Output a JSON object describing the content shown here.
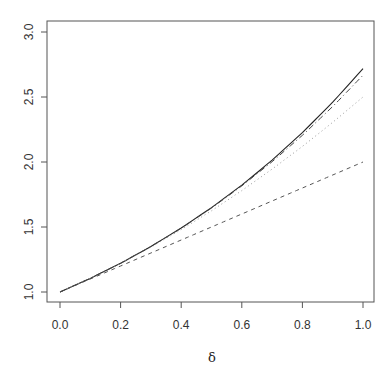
{
  "chart_data": {
    "type": "line",
    "title": "",
    "xlabel": "δ",
    "ylabel": "",
    "xlim": [
      0.0,
      1.0
    ],
    "ylim": [
      1.0,
      3.0
    ],
    "grid": false,
    "legend": null,
    "x_ticks": [
      "0.0",
      "0.2",
      "0.4",
      "0.6",
      "0.8",
      "1.0"
    ],
    "y_ticks": [
      "1.0",
      "1.5",
      "2.0",
      "2.5",
      "3.0"
    ],
    "x": [
      0.0,
      0.1,
      0.2,
      0.3,
      0.4,
      0.5,
      0.6,
      0.7,
      0.8,
      0.9,
      1.0
    ],
    "series": [
      {
        "name": "exp(δ)",
        "style": "solid",
        "values": [
          1.0,
          1.105,
          1.221,
          1.35,
          1.492,
          1.649,
          1.822,
          2.014,
          2.226,
          2.46,
          2.718
        ]
      },
      {
        "name": "1 + δ",
        "style": "dashed",
        "values": [
          1.0,
          1.1,
          1.2,
          1.3,
          1.4,
          1.5,
          1.6,
          1.7,
          1.8,
          1.9,
          2.0
        ]
      },
      {
        "name": "1 + δ + δ²/2",
        "style": "dotted",
        "values": [
          1.0,
          1.105,
          1.22,
          1.345,
          1.48,
          1.625,
          1.78,
          1.945,
          2.12,
          2.305,
          2.5
        ]
      },
      {
        "name": "1 + δ + δ²/2 + δ³/6",
        "style": "dashdot",
        "values": [
          1.0,
          1.105,
          1.221,
          1.35,
          1.491,
          1.646,
          1.816,
          2.002,
          2.205,
          2.427,
          2.667
        ]
      }
    ]
  },
  "colors": {
    "frame": "#555555",
    "solid": "#222222",
    "dashed": "#555555",
    "dotted": "#999999",
    "dashdot": "#444444"
  }
}
